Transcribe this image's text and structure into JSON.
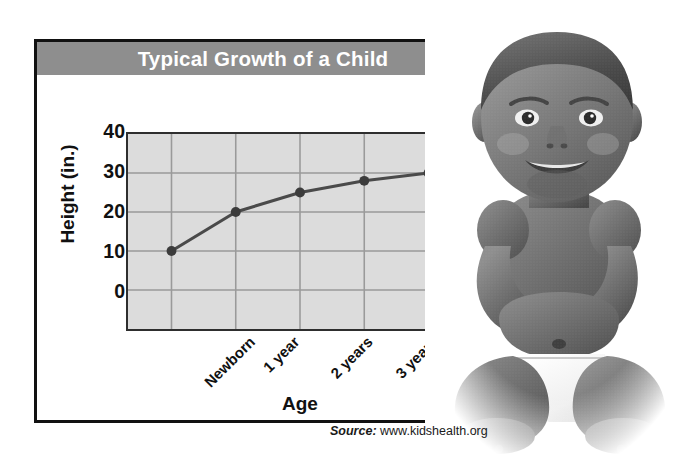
{
  "figure": {
    "title": "Typical Growth of a Child",
    "source_label": "Source:",
    "source_url": "www.kidshealth.org",
    "photo_alt": "baby-photo"
  },
  "colors": {
    "title_banner": "#8e8e8e",
    "title_text": "#ffffff",
    "plot_background": "#dcdcdc",
    "gridline": "#9a9a9a",
    "line_series": "#4a4a4a",
    "marker": "#3c3c3c",
    "card_border": "#111111",
    "page_background": "#ffffff"
  },
  "chart_data": {
    "type": "line",
    "title": "Typical Growth of a Child",
    "xlabel": "Age",
    "ylabel": "Height (in.)",
    "categories": [
      "Newborn",
      "1 year",
      "2 years",
      "3 years",
      "4 years"
    ],
    "values": [
      20,
      30,
      35,
      38,
      40
    ],
    "series": [
      {
        "name": "Height",
        "values": [
          20,
          30,
          35,
          38,
          40
        ]
      }
    ],
    "ylim": [
      0,
      50
    ],
    "yticks": [
      0,
      10,
      20,
      30,
      40
    ],
    "ytick_labels": [
      "0",
      "10",
      "20",
      "30",
      "40"
    ],
    "grid": true,
    "legend": "none",
    "markers": "filled-circle"
  }
}
